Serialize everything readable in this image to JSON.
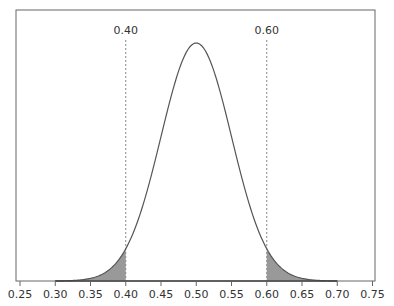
{
  "chart_data": {
    "type": "area",
    "title": "",
    "xlabel": "",
    "ylabel": "",
    "distribution": {
      "mean": 0.5,
      "sd": 0.05
    },
    "x_range": [
      0.3,
      0.7
    ],
    "xlim": [
      0.245,
      0.755
    ],
    "x_ticks": [
      "0.25",
      "0.30",
      "0.35",
      "0.40",
      "0.45",
      "0.50",
      "0.55",
      "0.60",
      "0.65",
      "0.70",
      "0.75"
    ],
    "cutoffs": [
      {
        "value": 0.4,
        "label": "0.40"
      },
      {
        "value": 0.6,
        "label": "0.60"
      }
    ],
    "shaded_regions": [
      {
        "from": 0.3,
        "to": 0.4
      },
      {
        "from": 0.6,
        "to": 0.7
      }
    ],
    "grid": false,
    "legend": null
  },
  "colors": {
    "curve": "#555555",
    "shade": "#999999",
    "frame": "#666666",
    "cutoff_line": "#888888",
    "text": "#333333"
  }
}
